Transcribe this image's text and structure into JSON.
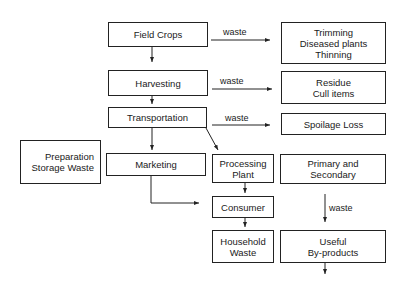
{
  "nodes": {
    "field_crops": {
      "lines": [
        "Field Crops"
      ]
    },
    "trimming": {
      "lines": [
        "Trimming",
        "Diseased plants",
        "Thinning"
      ]
    },
    "harvesting": {
      "lines": [
        "Harvesting"
      ]
    },
    "residue": {
      "lines": [
        "Residue",
        "Cull items"
      ]
    },
    "transportation": {
      "lines": [
        "Transportation"
      ]
    },
    "spoilage": {
      "lines": [
        "Spoilage Loss"
      ]
    },
    "preparation": {
      "lines": [
        "Preparation",
        "Storage Waste"
      ]
    },
    "marketing": {
      "lines": [
        "Marketing"
      ]
    },
    "processing": {
      "lines": [
        "Processing",
        "Plant"
      ]
    },
    "primary": {
      "lines": [
        "Primary and",
        "Secondary"
      ]
    },
    "consumer": {
      "lines": [
        "Consumer"
      ]
    },
    "household": {
      "lines": [
        "Household",
        "Waste"
      ]
    },
    "byproducts": {
      "lines": [
        "Useful",
        "By-products"
      ]
    }
  },
  "edge_labels": {
    "waste1": "waste",
    "waste2": "waste",
    "waste3": "waste",
    "waste4": "waste"
  }
}
